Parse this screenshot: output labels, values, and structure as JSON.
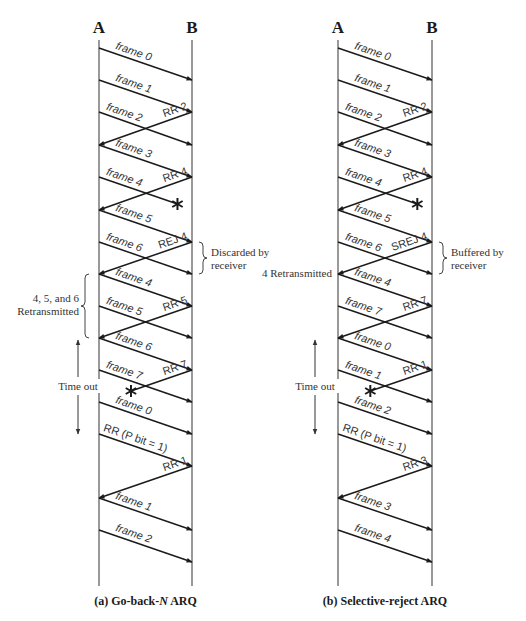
{
  "diagrams": [
    {
      "id": "a",
      "caption_prefix": "(a) Go-back-",
      "caption_italic": "N",
      "caption_suffix": " ARQ",
      "station_a": "A",
      "station_b": "B",
      "ax": 99,
      "bx": 192,
      "line_top": 40,
      "line_bottom": 586,
      "messages": [
        {
          "dir": "AB",
          "label": "frame 0",
          "y1": 48,
          "y2": 80
        },
        {
          "dir": "AB",
          "label": "frame 1",
          "y1": 80,
          "y2": 112
        },
        {
          "dir": "AB",
          "label": "frame 2",
          "y1": 112,
          "y2": 145
        },
        {
          "dir": "BA",
          "label": "RR 2",
          "y1": 112,
          "y2": 145
        },
        {
          "dir": "AB",
          "label": "frame 3",
          "y1": 145,
          "y2": 177
        },
        {
          "dir": "AB",
          "label": "frame 4",
          "y1": 177,
          "y2": 204,
          "lost": true
        },
        {
          "dir": "BA",
          "label": "RR 4",
          "y1": 177,
          "y2": 210
        },
        {
          "dir": "AB",
          "label": "frame 5",
          "y1": 210,
          "y2": 242
        },
        {
          "dir": "AB",
          "label": "frame 6",
          "y1": 242,
          "y2": 274
        },
        {
          "dir": "BA",
          "label": "REJ 4",
          "y1": 242,
          "y2": 274
        },
        {
          "dir": "AB",
          "label": "frame 4",
          "y1": 274,
          "y2": 306
        },
        {
          "dir": "AB",
          "label": "frame 5",
          "y1": 306,
          "y2": 338
        },
        {
          "dir": "BA",
          "label": "RR 5",
          "y1": 306,
          "y2": 338
        },
        {
          "dir": "AB",
          "label": "frame 6",
          "y1": 338,
          "y2": 370
        },
        {
          "dir": "AB",
          "label": "frame 7",
          "y1": 370,
          "y2": 402
        },
        {
          "dir": "BA",
          "label": "RR 7",
          "y1": 370,
          "y2": 391,
          "lost": true
        },
        {
          "dir": "AB",
          "label": "frame 0",
          "y1": 402,
          "y2": 434
        },
        {
          "dir": "AB",
          "label": "RR (P bit = 1)",
          "y1": 434,
          "y2": 466
        },
        {
          "dir": "BA",
          "label": "RR 1",
          "y1": 466,
          "y2": 498
        },
        {
          "dir": "AB",
          "label": "frame 1",
          "y1": 498,
          "y2": 530
        },
        {
          "dir": "AB",
          "label": "frame 2",
          "y1": 530,
          "y2": 562
        }
      ],
      "braces": [
        {
          "side": "right",
          "y1": 242,
          "y2": 274,
          "lines": [
            "Discarded by",
            "receiver"
          ]
        },
        {
          "side": "left",
          "y1": 274,
          "y2": 338,
          "lines": [
            "4, 5, and 6",
            "Retransmitted"
          ]
        }
      ],
      "timeout": {
        "label": "Time out",
        "x": 78,
        "y1": 340,
        "y2": 434
      }
    },
    {
      "id": "b",
      "caption_prefix": "(b) Selective-reject ARQ",
      "caption_italic": "",
      "caption_suffix": "",
      "station_a": "A",
      "station_b": "B",
      "ax": 338,
      "bx": 432,
      "line_top": 40,
      "line_bottom": 586,
      "messages": [
        {
          "dir": "AB",
          "label": "frame 0",
          "y1": 48,
          "y2": 80
        },
        {
          "dir": "AB",
          "label": "frame 1",
          "y1": 80,
          "y2": 112
        },
        {
          "dir": "AB",
          "label": "frame 2",
          "y1": 112,
          "y2": 145
        },
        {
          "dir": "BA",
          "label": "RR 2",
          "y1": 112,
          "y2": 145
        },
        {
          "dir": "AB",
          "label": "frame 3",
          "y1": 145,
          "y2": 177
        },
        {
          "dir": "AB",
          "label": "frame 4",
          "y1": 177,
          "y2": 204,
          "lost": true
        },
        {
          "dir": "BA",
          "label": "RR 4",
          "y1": 177,
          "y2": 210
        },
        {
          "dir": "AB",
          "label": "frame 5",
          "y1": 210,
          "y2": 242
        },
        {
          "dir": "AB",
          "label": "frame 6",
          "y1": 242,
          "y2": 274
        },
        {
          "dir": "BA",
          "label": "SREJ 4",
          "y1": 242,
          "y2": 274
        },
        {
          "dir": "AB",
          "label": "frame 4",
          "y1": 274,
          "y2": 306
        },
        {
          "dir": "AB",
          "label": "frame 7",
          "y1": 306,
          "y2": 338
        },
        {
          "dir": "BA",
          "label": "RR 7",
          "y1": 306,
          "y2": 338
        },
        {
          "dir": "AB",
          "label": "frame 0",
          "y1": 338,
          "y2": 370
        },
        {
          "dir": "AB",
          "label": "frame 1",
          "y1": 370,
          "y2": 402
        },
        {
          "dir": "BA",
          "label": "RR 1",
          "y1": 370,
          "y2": 391,
          "lost": true
        },
        {
          "dir": "AB",
          "label": "frame 2",
          "y1": 402,
          "y2": 434
        },
        {
          "dir": "AB",
          "label": "RR (P bit = 1)",
          "y1": 434,
          "y2": 466
        },
        {
          "dir": "BA",
          "label": "RR 3",
          "y1": 466,
          "y2": 498
        },
        {
          "dir": "AB",
          "label": "frame 3",
          "y1": 498,
          "y2": 530
        },
        {
          "dir": "AB",
          "label": "frame 4",
          "y1": 530,
          "y2": 562
        }
      ],
      "braces": [
        {
          "side": "right",
          "y1": 242,
          "y2": 274,
          "lines": [
            "Buffered by",
            "receiver"
          ]
        },
        {
          "side": "left-plain",
          "y1": 274,
          "y2": 274,
          "lines": [
            "4 Retransmitted"
          ]
        }
      ],
      "timeout": {
        "label": "Time out",
        "x": 315,
        "y1": 340,
        "y2": 434
      }
    }
  ],
  "colors": {
    "ink": "#1a1a1a",
    "timeline": "#555555",
    "text": "#333333",
    "background": "#ffffff"
  }
}
